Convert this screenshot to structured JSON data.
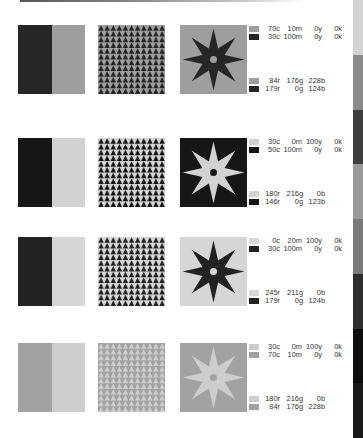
{
  "rows": [
    {
      "block": {
        "left": "#262626",
        "right": "#9e9e9e"
      },
      "pattern": {
        "background": "#9e9e9e",
        "triangle": "#262626"
      },
      "star": {
        "background": "#9e9e9e",
        "fill": "#262626",
        "dot": "#9e9e9e"
      },
      "cmyk": [
        {
          "swatch": "#9e9e9e",
          "c": "70c",
          "m": "10m",
          "y": "0y",
          "k": "0k"
        },
        {
          "swatch": "#262626",
          "c": "30c",
          "m": "100m",
          "y": "0y",
          "k": "0k"
        }
      ],
      "rgb": [
        {
          "swatch": "#9e9e9e",
          "r": "84r",
          "g": "176g",
          "b": "228b"
        },
        {
          "swatch": "#262626",
          "r": "179r",
          "g": "0g",
          "b": "124b"
        }
      ]
    },
    {
      "block": {
        "left": "#161616",
        "right": "#d2d2d2"
      },
      "pattern": {
        "background": "#d2d2d2",
        "triangle": "#161616"
      },
      "star": {
        "background": "#161616",
        "fill": "#d2d2d2",
        "dot": "#161616"
      },
      "cmyk": [
        {
          "swatch": "#d2d2d2",
          "c": "30c",
          "m": "0m",
          "y": "100y",
          "k": "0k"
        },
        {
          "swatch": "#161616",
          "c": "50c",
          "m": "100m",
          "y": "0y",
          "k": "0k"
        }
      ],
      "rgb": [
        {
          "swatch": "#d2d2d2",
          "r": "180r",
          "g": "216g",
          "b": "0b"
        },
        {
          "swatch": "#161616",
          "r": "146r",
          "g": "0g",
          "b": "123b"
        }
      ]
    },
    {
      "block": {
        "left": "#222222",
        "right": "#d6d6d6"
      },
      "pattern": {
        "background": "#d6d6d6",
        "triangle": "#222222"
      },
      "star": {
        "background": "#d6d6d6",
        "fill": "#222222",
        "dot": "#d6d6d6"
      },
      "cmyk": [
        {
          "swatch": "#d6d6d6",
          "c": "0c",
          "m": "20m",
          "y": "100y",
          "k": "0k"
        },
        {
          "swatch": "#222222",
          "c": "30c",
          "m": "100m",
          "y": "0y",
          "k": "0k"
        }
      ],
      "rgb": [
        {
          "swatch": "#d6d6d6",
          "r": "245r",
          "g": "211g",
          "b": "0b"
        },
        {
          "swatch": "#222222",
          "r": "179r",
          "g": "0g",
          "b": "124b"
        }
      ]
    },
    {
      "block": {
        "left": "#a2a2a2",
        "right": "#cdcdcd"
      },
      "pattern": {
        "background": "#a2a2a2",
        "triangle": "#cdcdcd"
      },
      "star": {
        "background": "#a2a2a2",
        "fill": "#cdcdcd",
        "dot": "#a2a2a2"
      },
      "cmyk": [
        {
          "swatch": "#cdcdcd",
          "c": "30c",
          "m": "0m",
          "y": "100y",
          "k": "0k"
        },
        {
          "swatch": "#a2a2a2",
          "c": "70c",
          "m": "10m",
          "y": "0y",
          "k": "0k"
        }
      ],
      "rgb": [
        {
          "swatch": "#cdcdcd",
          "r": "180r",
          "g": "216g",
          "b": "0b"
        },
        {
          "swatch": "#a2a2a2",
          "r": "84r",
          "g": "176g",
          "b": "228b"
        }
      ]
    }
  ],
  "edge_strip": [
    "#d4d4d4",
    "#8a8a8a",
    "#3e3e3e",
    "#9a9a9a",
    "#7a7a7a",
    "#2e2e2e",
    "#0e0e0e",
    "#1a1a1a"
  ]
}
